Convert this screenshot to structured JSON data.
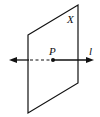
{
  "diagram": {
    "plane": {
      "label": "X",
      "vertices": [
        [
          28,
          35
        ],
        [
          78,
          5
        ],
        [
          78,
          83
        ],
        [
          28,
          113
        ]
      ]
    },
    "line": {
      "label": "l",
      "y": 60,
      "x_start": 9,
      "x_end": 94,
      "hidden_segment": [
        29,
        53
      ]
    },
    "point": {
      "label": "P",
      "x": 53,
      "y": 60
    },
    "colors": {
      "stroke": "#111111",
      "background": "#ffffff"
    }
  }
}
